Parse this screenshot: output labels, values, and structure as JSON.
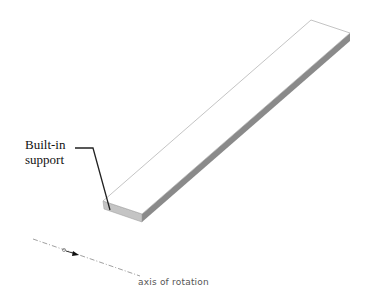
{
  "diagram": {
    "callout": {
      "line1": "Built-in",
      "line2": "support"
    },
    "axis_label": "axis of rotation",
    "colors": {
      "top_face": "#ffffff",
      "edge": "#999999",
      "side_face": "#8a8a8a",
      "front_face": "#c4c4c4",
      "leader": "#222222",
      "axis": "#888888"
    }
  }
}
